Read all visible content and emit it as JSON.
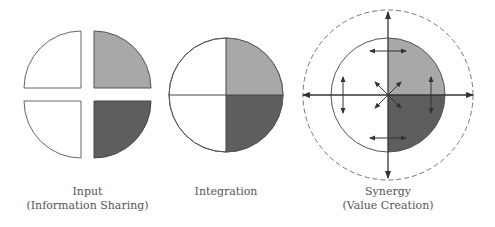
{
  "colors": {
    "stroke": "#555555",
    "light_fill": "#a8a8a8",
    "dark_fill": "#5e5e5e",
    "white_fill": "#ffffff",
    "text": "#555555"
  },
  "panels": [
    {
      "id": "input",
      "title": "Input",
      "subtitle": "(Information Sharing)",
      "quadrants": [
        "top-left: white",
        "top-right: light gray",
        "bottom-left: white",
        "bottom-right: dark gray"
      ],
      "style": "separated quadrants"
    },
    {
      "id": "integration",
      "title": "Integration",
      "subtitle": "",
      "quadrants": [
        "top-left: white",
        "top-right: light gray",
        "bottom-left: white",
        "bottom-right: dark gray"
      ],
      "style": "joined circle"
    },
    {
      "id": "synergy",
      "title": "Synergy",
      "subtitle": "(Value Creation)",
      "quadrants": [
        "left half: white",
        "top-right: light gray",
        "bottom-right: dark gray"
      ],
      "style": "circle with arrows and dashed outer boundary",
      "arrows": [
        "vertical axis double arrow",
        "horizontal axis double arrow",
        "diagonal X arrows at center",
        "top horizontal double arrow",
        "bottom horizontal double arrow",
        "left vertical double arrow",
        "right vertical double arrow"
      ]
    }
  ]
}
